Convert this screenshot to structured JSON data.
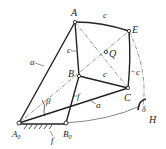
{
  "points": {
    "A": {
      "label": "A",
      "x": 75,
      "y": 22
    },
    "E": {
      "label": "E",
      "x": 129,
      "y": 31
    },
    "Q": {
      "label": "Q",
      "x": 106,
      "y": 52
    },
    "B": {
      "label": "B",
      "x": 79,
      "y": 76
    },
    "C": {
      "label": "C",
      "x": 128,
      "y": 88
    },
    "A0": {
      "label": "A",
      "sub": "0",
      "x": 19,
      "y": 123
    },
    "B0": {
      "label": "B",
      "sub": "0",
      "x": 66,
      "y": 123
    }
  },
  "link_labels": {
    "a_upper": "a",
    "a_lower": "a",
    "c_AE": "c",
    "c_AB": "c",
    "c_BC": "c",
    "c_EC": "c",
    "f_BB0": "f",
    "f_ground": "f"
  },
  "angle_labels": {
    "beta": "β",
    "delta": "δ"
  },
  "other_labels": {
    "H": "H"
  },
  "colors": {
    "stroke": "#222222",
    "background": "#ffffff"
  }
}
